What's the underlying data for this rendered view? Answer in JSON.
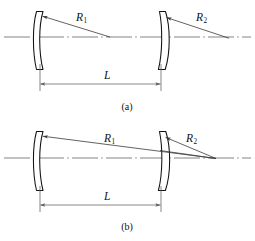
{
  "figure": {
    "background_color": "#ffffff",
    "line_color": "#111111",
    "axis_color": "#6d6d6d",
    "width": 255,
    "height": 241
  },
  "panels": [
    {
      "id": "a",
      "caption": "(a)",
      "caption_x": 127,
      "caption_y": 108,
      "description": "Two meniscus mirrors with separate centers of curvature on the optical axis",
      "axis": {
        "y": 37,
        "x_start": 4,
        "x_end": 251
      },
      "left_mirror": {
        "name": "left-mirror",
        "x_front": 36,
        "x_back": 43,
        "y_top": 11,
        "y_bottom": 70
      },
      "right_mirror": {
        "name": "right-mirror",
        "x_front": 157,
        "x_back": 166,
        "y_top": 11,
        "y_bottom": 70
      },
      "radii": [
        {
          "label": "R",
          "subscript": "1",
          "label_x": 76,
          "label_y": 21,
          "arrow_from_x": 110,
          "arrow_from_y": 37,
          "arrow_to_x": 41,
          "arrow_to_y": 16
        },
        {
          "label": "R",
          "subscript": "2",
          "label_x": 196,
          "label_y": 21,
          "arrow_from_x": 229,
          "arrow_from_y": 38,
          "arrow_to_x": 165,
          "arrow_to_y": 17
        }
      ],
      "dimension": {
        "label": "L",
        "label_x": 108,
        "label_y": 78,
        "line_y": 84,
        "x_left": 40,
        "x_right": 161,
        "ext_left_x": 40,
        "ext_right_x": 161,
        "ext_top_y": 64,
        "ext_bottom_y": 90
      }
    },
    {
      "id": "b",
      "caption": "(b)",
      "caption_x": 127,
      "caption_y": 228,
      "description": "Two meniscus mirrors with a common center of curvature right of the cavity",
      "axis": {
        "y": 158,
        "x_start": 4,
        "x_end": 251
      },
      "left_mirror": {
        "name": "left-mirror",
        "x_front": 36,
        "x_back": 43,
        "y_top": 131,
        "y_bottom": 191
      },
      "right_mirror": {
        "name": "right-mirror",
        "x_front": 157,
        "x_back": 166,
        "y_top": 131,
        "y_bottom": 191
      },
      "radii": [
        {
          "label": "R",
          "subscript": "1",
          "label_x": 108,
          "label_y": 142,
          "arrow_from_x": 216,
          "arrow_from_y": 158,
          "arrow_to_x": 41,
          "arrow_to_y": 136
        },
        {
          "label": "R",
          "subscript": "2",
          "label_x": 190,
          "label_y": 142,
          "arrow_from_x": 216,
          "arrow_from_y": 158,
          "arrow_to_x": 164,
          "arrow_to_y": 137
        }
      ],
      "dimension": {
        "label": "L",
        "label_x": 108,
        "label_y": 198,
        "line_y": 205,
        "x_left": 40,
        "x_right": 161,
        "ext_left_x": 40,
        "ext_right_x": 161,
        "ext_top_y": 186,
        "ext_bottom_y": 211
      }
    }
  ]
}
